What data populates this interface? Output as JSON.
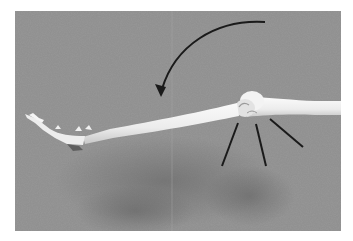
{
  "figure": {
    "colors": {
      "background": "#8e8e8e",
      "background_dark": "#7a7a7a",
      "shadow": "#6e6e6e",
      "bone": "#f1f1f1",
      "bone_shade": "#cfcfcf",
      "annotation": "#1a1a1a",
      "page": "#ffffff"
    },
    "annotations": {
      "arrow": {
        "direction": "counterclockwise",
        "meaning": "folding rotation"
      },
      "radiating_lines": 3
    }
  }
}
